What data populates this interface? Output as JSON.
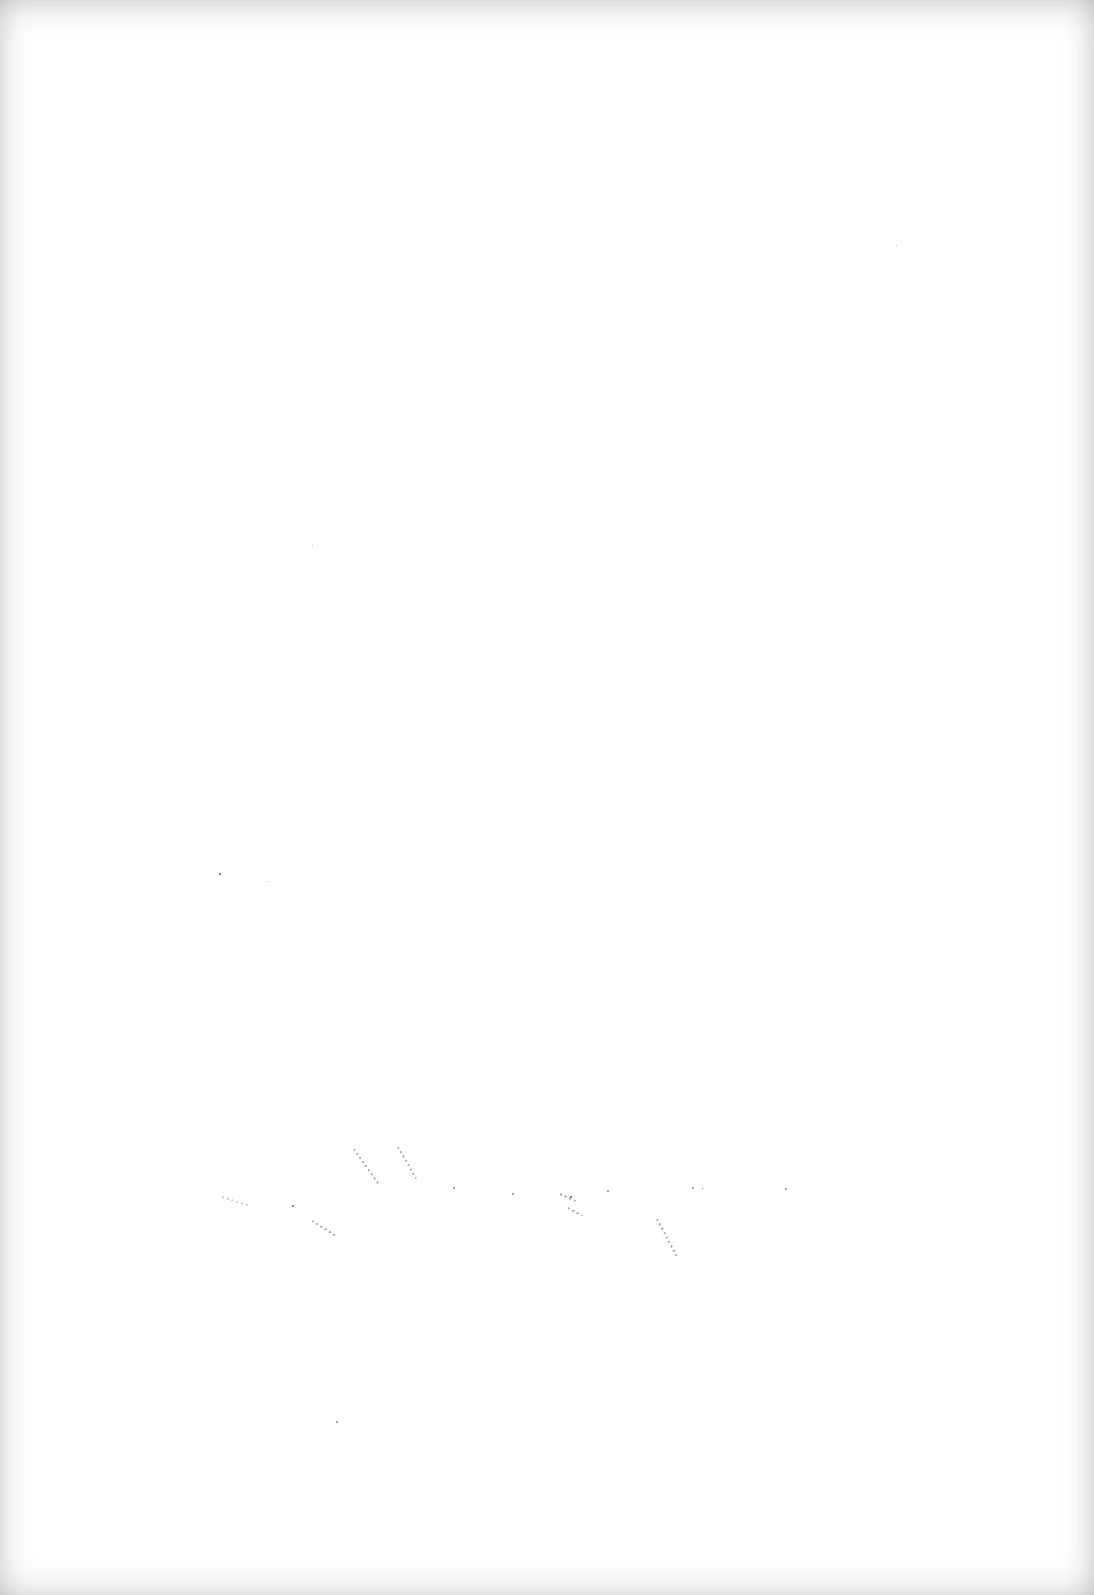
{
  "page": {
    "type": "blank-scanned-page",
    "background_color": "#ffffff",
    "edge_shadow_color": "#9a9a9a",
    "text_content": ""
  }
}
